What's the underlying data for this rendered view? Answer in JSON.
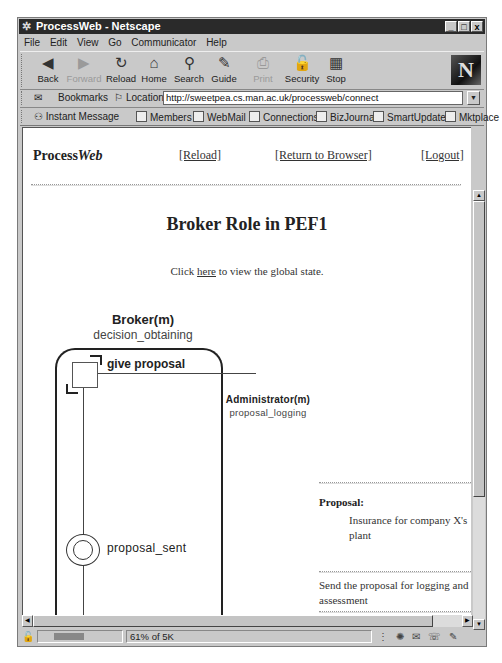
{
  "window": {
    "title": "ProcessWeb - Netscape",
    "controls": {
      "minimize": "_",
      "maximize": "□",
      "close": "x"
    }
  },
  "menubar": {
    "items": [
      {
        "label": "File"
      },
      {
        "label": "Edit"
      },
      {
        "label": "View"
      },
      {
        "label": "Go"
      },
      {
        "label": "Communicator"
      },
      {
        "label": "Help"
      }
    ]
  },
  "toolbar": {
    "buttons": [
      {
        "label": "Back",
        "icon": "back-icon",
        "glyph": "◀",
        "enabled": true
      },
      {
        "label": "Forward",
        "icon": "forward-icon",
        "glyph": "▶",
        "enabled": false
      },
      {
        "label": "Reload",
        "icon": "reload-icon",
        "glyph": "↻",
        "enabled": true
      },
      {
        "label": "Home",
        "icon": "home-icon",
        "glyph": "⌂",
        "enabled": true
      },
      {
        "label": "Search",
        "icon": "search-icon",
        "glyph": "⚲",
        "enabled": true
      },
      {
        "label": "Guide",
        "icon": "guide-icon",
        "glyph": "✎",
        "enabled": true
      },
      {
        "label": "Print",
        "icon": "print-icon",
        "glyph": "⎙",
        "enabled": false
      },
      {
        "label": "Security",
        "icon": "lock-icon",
        "glyph": "🔓",
        "enabled": true
      },
      {
        "label": "Stop",
        "icon": "stop-icon",
        "glyph": "▦",
        "enabled": true
      }
    ],
    "logo": "N"
  },
  "location_bar": {
    "bookmarks_label": "Bookmarks",
    "location_label": "Location:",
    "url": "http://sweetpea.cs.man.ac.uk/processweb/connect"
  },
  "personal_toolbar": {
    "items": [
      {
        "label": "Instant Message"
      },
      {
        "label": "Members"
      },
      {
        "label": "WebMail"
      },
      {
        "label": "Connections"
      },
      {
        "label": "BizJournal"
      },
      {
        "label": "SmartUpdate"
      },
      {
        "label": "Mktplace"
      }
    ]
  },
  "page": {
    "logo_plain": "Process",
    "logo_italic": "Web",
    "nav": {
      "reload": "[Reload]",
      "return": "[Return to Browser]",
      "logout": "[Logout]"
    },
    "title": "Broker Role in PEF1",
    "click_prefix": "Click ",
    "click_link": "here",
    "click_suffix": " to view the global state."
  },
  "diagram": {
    "role_name": "Broker(m)",
    "role_state": "decision_obtaining",
    "action_label": "give proposal",
    "partner_name": "Administrator(m)",
    "partner_state": "proposal_logging",
    "state_label": "proposal_sent"
  },
  "details": {
    "proposal_label": "Proposal:",
    "proposal_value": "Insurance for company X's plant",
    "instruction": "Send the proposal for logging and assessment"
  },
  "statusbar": {
    "text": "61% of 5K"
  }
}
